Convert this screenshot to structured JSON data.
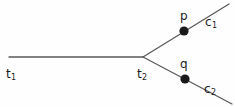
{
  "diagram": {
    "type": "branching-tree-diagram",
    "background_color": "#fefefe",
    "stroke_color": "#5a5a5a",
    "dot_color": "#1a1a1a",
    "text_color": "#1d1d1d",
    "edges": [
      {
        "name": "trunk-edge",
        "from": [
          9,
          57
        ],
        "to": [
          143,
          57
        ]
      },
      {
        "name": "upper-branch-edge",
        "from": [
          143,
          57
        ],
        "to": [
          229,
          4
        ]
      },
      {
        "name": "lower-branch-edge",
        "from": [
          143,
          57
        ],
        "to": [
          232,
          104
        ]
      }
    ],
    "vertices": [
      {
        "name": "branch-vertex",
        "x": 143,
        "y": 57,
        "rendered": false
      },
      {
        "name": "point-p-dot",
        "x": 184,
        "y": 31,
        "radius": 4.6,
        "rendered": true
      },
      {
        "name": "point-q-dot",
        "x": 185,
        "y": 79,
        "radius": 4.6,
        "rendered": true
      }
    ],
    "labels": {
      "t1": {
        "base": "t",
        "sub": "1"
      },
      "t2": {
        "base": "t",
        "sub": "2"
      },
      "p": {
        "base": "p",
        "sub": ""
      },
      "q": {
        "base": "q",
        "sub": ""
      },
      "c1": {
        "base": "c",
        "sub": "1"
      },
      "c2": {
        "base": "c",
        "sub": "2"
      }
    }
  }
}
